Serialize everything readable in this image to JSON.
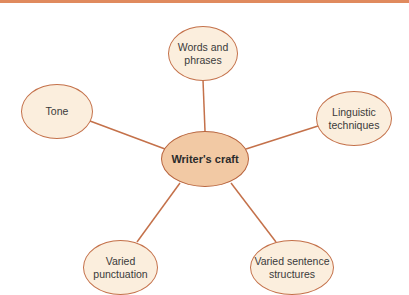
{
  "diagram": {
    "center": {
      "label": "Writer's craft"
    },
    "nodes": [
      {
        "id": "words-and-phrases",
        "label": "Words and\nphrases"
      },
      {
        "id": "tone",
        "label": "Tone"
      },
      {
        "id": "linguistic-techniques",
        "label": "Linguistic\ntechniques"
      },
      {
        "id": "varied-punctuation",
        "label": "Varied\npunctuation"
      },
      {
        "id": "varied-sentence-structures",
        "label": "Varied sentence\nstructures"
      }
    ]
  },
  "colors": {
    "accent_rule": "#e08a5e",
    "node_fill": "#fbeedd",
    "node_border": "#c4714a",
    "center_fill": "#f2c9a4",
    "connector": "#c4714a"
  }
}
